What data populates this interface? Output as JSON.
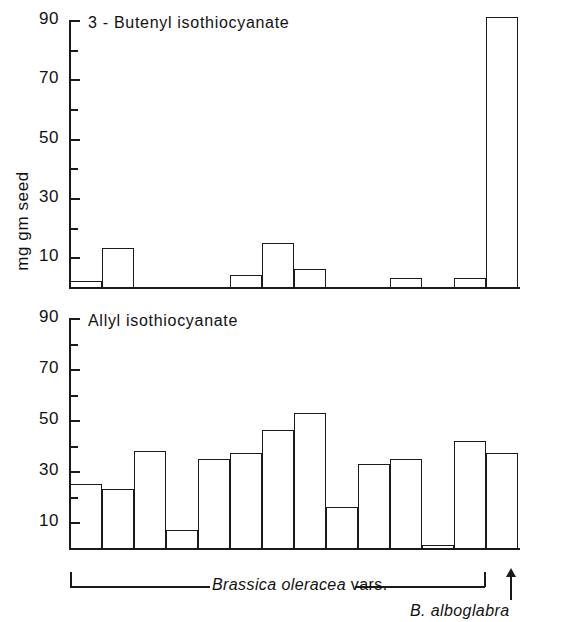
{
  "figure": {
    "y_axis_caption": "mg gm seed",
    "background": "#ffffff",
    "ink_color": "#1a1a1a"
  },
  "panels": [
    {
      "id": "butenyl",
      "title": "3 - Butenyl  isothiocyanate",
      "tick_labels": [
        "90",
        "70",
        "50",
        "30",
        "10"
      ]
    },
    {
      "id": "allyl",
      "title": "Allyl isothiocyanate",
      "tick_labels": [
        "90",
        "70",
        "50",
        "30",
        "10"
      ]
    }
  ],
  "annotations": {
    "group_label_italic": "Brassica oleracea",
    "group_label_roman": " vars.",
    "outlier_label": "B. alboglabra",
    "arrow_icon": "up-arrow-icon"
  },
  "chart_data": [
    {
      "type": "bar",
      "title": "3 - Butenyl  isothiocyanate",
      "xlabel": "",
      "ylabel": "mg gm seed",
      "ylim": [
        0,
        92
      ],
      "yticks": [
        10,
        30,
        50,
        70,
        90
      ],
      "yticks_minor": [
        20,
        40,
        60,
        80
      ],
      "grid": false,
      "legend": "none",
      "categories": [
        "1",
        "2",
        "3",
        "4",
        "5",
        "6",
        "7",
        "8",
        "9",
        "10",
        "11",
        "12",
        "13",
        "14"
      ],
      "values": [
        2,
        13,
        0,
        0,
        0,
        4,
        15,
        6,
        0,
        0,
        3,
        0,
        3,
        91
      ]
    },
    {
      "type": "bar",
      "title": "Allyl isothiocyanate",
      "xlabel": "",
      "ylabel": "mg gm seed",
      "ylim": [
        0,
        92
      ],
      "yticks": [
        10,
        30,
        50,
        70,
        90
      ],
      "yticks_minor": [
        20,
        40,
        60,
        80
      ],
      "grid": false,
      "legend": "none",
      "categories": [
        "1",
        "2",
        "3",
        "4",
        "5",
        "6",
        "7",
        "8",
        "9",
        "10",
        "11",
        "12",
        "13",
        "14"
      ],
      "values": [
        25,
        23,
        38,
        7,
        35,
        37,
        46,
        53,
        16,
        33,
        35,
        1,
        42,
        37
      ]
    }
  ]
}
